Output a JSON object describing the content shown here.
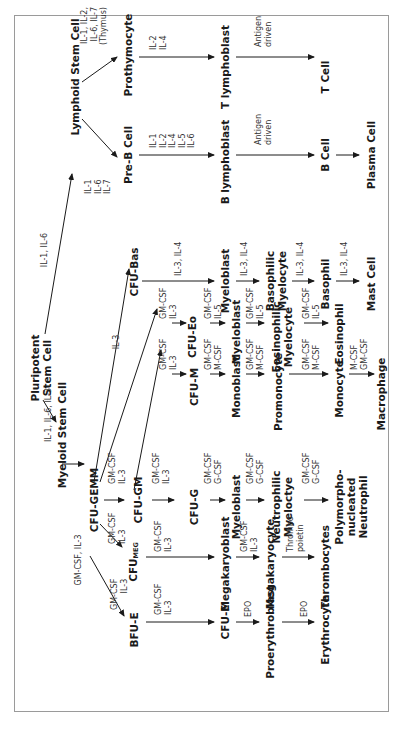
{
  "diagram": {
    "nodes": {
      "pluripotent": "Pluripotent",
      "pluripotent2": "Stem Cell",
      "lymphoid": "Lymphoid Stem Cell",
      "myeloid": "Myeloid Stem Cell",
      "prothymocyte": "Prothymocyte",
      "t_lymphoblast": "T lymphoblast",
      "t_cell": "T Cell",
      "pre_b": "Pre-B Cell",
      "b_lymphoblast": "B lymphoblast",
      "b_cell": "B Cell",
      "plasma_cell": "Plasma Cell",
      "cfu_gemm": "CFU-GEMM",
      "cfu_bas": "CFU-Bas",
      "bas_myeloblast": "Myeloblast",
      "basophilic1": "Basophilic",
      "basophilic2": "Myelocyte",
      "basophil": "Basophil",
      "mast_cell": "Mast Cell",
      "cfu_eo": "CFU-Eo",
      "eo_myeloblast": "Myeloblast",
      "eosinophilic1": "Eosinophilic",
      "eosinophilic2": "Myelocyte",
      "eosinophil": "Eosinophil",
      "cfu_gm": "CFU-GM",
      "cfu_m": "CFU-M",
      "monoblast": "Monoblast",
      "promonocyte": "Promonocyte",
      "monocyte": "Monocyte",
      "macrophage": "Macrophage",
      "cfu_g": "CFU-G",
      "neu_myeloblast": "Myeloblast",
      "neutrophilic1": "Neutrophilic",
      "neutrophilic2": "Myeloctye",
      "poly1": "Polymorpho-",
      "poly2": "nucleated",
      "poly3": "Neutrophil",
      "cfu_meg": "CFU",
      "cfu_meg_sub": "MEG",
      "megakaryoblast": "Megakaryoblast",
      "megakaryocyte": "Megakaryocyte",
      "thrombocytes": "Thrombocytes",
      "bfu_e": "BFU-E",
      "cfu_e": "CFU-E",
      "proerythroblast": "Proerythroblast",
      "erythrocyte": "Erythrocyte"
    },
    "cytokines": {
      "to_lymphoid": "IL-1, IL-6",
      "to_myeloid": "IL-1, IL-6, IL-3",
      "lymphoid_il": [
        "IL-1",
        "IL-6",
        "IL-7"
      ],
      "thymus": [
        "IL-1, IL-2,",
        "IL-6, IL-7",
        "(Thymus)"
      ],
      "prothymo_to_tlympho": [
        "IL-2",
        "IL-4"
      ],
      "preb_to_blympho": [
        "IL-1",
        "IL-2",
        "IL-4",
        "IL-5",
        "IL-6"
      ],
      "t_antigen": [
        "Antigen",
        "driven"
      ],
      "b_antigen": [
        "Antigen",
        "driven"
      ],
      "myeloid_to_gemm": "GM-CSF, IL-3",
      "to_cfu_bas": "IL-3",
      "bas1": "IL-3, IL-4",
      "bas2": "IL-3, IL-4",
      "bas3": "IL-3, IL-4",
      "bas4": "IL-3, IL-4",
      "eo0": [
        "GM-CSF",
        "IL-3"
      ],
      "eo1": [
        "GM-CSF",
        "IL-5"
      ],
      "eo2": [
        "GM-CSF",
        "IL-5"
      ],
      "eo3": [
        "GM-CSF",
        "IL-5"
      ],
      "m0": [
        "GM-CSF",
        "IL-3"
      ],
      "m1": [
        "GM-CSF",
        "M-CSF"
      ],
      "m2": [
        "GM-CSF",
        "M-CSF"
      ],
      "m3": [
        "GM-CSF",
        "M-CSF"
      ],
      "m4": [
        "M-CSF",
        "GM-CSF"
      ],
      "gemm_to_gm": [
        "GM-CSF",
        "IL-3"
      ],
      "gemm_to_meg": [
        "GM-CSF",
        "IL-3"
      ],
      "gm_to_g": [
        "GM-CSF",
        "IL-3"
      ],
      "g1": [
        "GM-CSF",
        "G-CSF"
      ],
      "g2": [
        "GM-CSF",
        "G-CSF"
      ],
      "g3": [
        "GM-CSF",
        "G-CSF"
      ],
      "meg1": [
        "GM-CSF",
        "IL-3"
      ],
      "meg2": [
        "GM-CSF",
        "IL-3"
      ],
      "meg3": [
        "Thrombo-",
        "poietin"
      ],
      "bfu": [
        "GM-CSF",
        "IL-3"
      ],
      "e1": [
        "GM-CSF",
        "IL-3"
      ],
      "e2": "EPO",
      "e3": "EPO"
    }
  }
}
